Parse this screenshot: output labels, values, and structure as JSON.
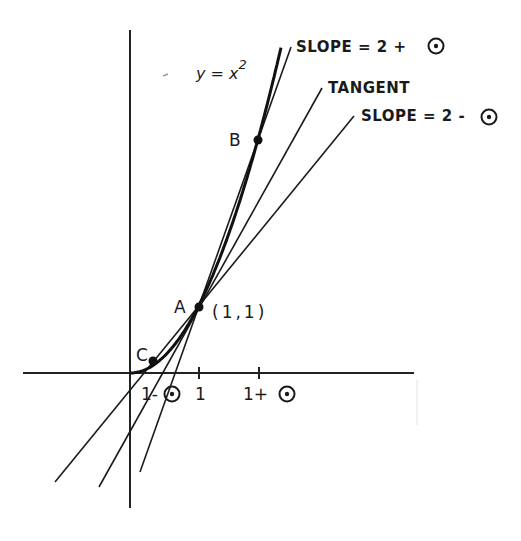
{
  "diagram": {
    "curve_label": "y = x",
    "curve_exponent": "2",
    "lines": [
      {
        "id": "secant-ab",
        "label": "SLOPE = 2 + ",
        "epsilon": "ε"
      },
      {
        "id": "tangent",
        "label": "TANGENT"
      },
      {
        "id": "secant-ca",
        "label": "SLOPE = 2 - ",
        "epsilon": "ε"
      }
    ],
    "points": [
      {
        "id": "A",
        "label": "A",
        "coord_label": "(1,1)"
      },
      {
        "id": "B",
        "label": "B"
      },
      {
        "id": "C",
        "label": "C"
      }
    ],
    "x_ticks": [
      {
        "label": "1- ",
        "epsilon": true
      },
      {
        "label": "1",
        "epsilon": false
      },
      {
        "label": "1+ ",
        "epsilon": true
      }
    ],
    "epsilon_symbol": "circled-dot"
  }
}
